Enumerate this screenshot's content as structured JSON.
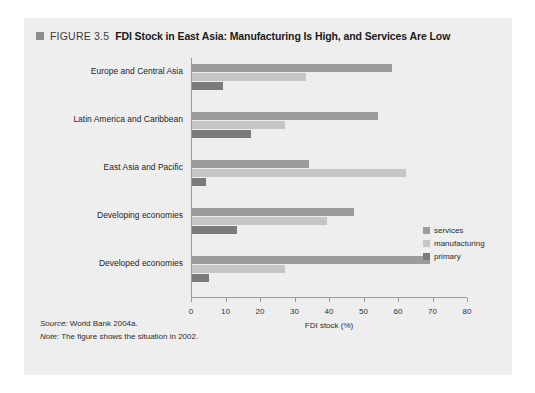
{
  "figure": {
    "marker_icon": "square-marker-icon",
    "number": "FIGURE 3.5",
    "title": "FDI Stock in East Asia: Manufacturing Is High, and Services Are Low"
  },
  "footnotes": {
    "source_key": "Source:",
    "source_text": " World Bank 2004a.",
    "note_key": "Note:",
    "note_text": " The figure shows the situation in 2002."
  },
  "colors": {
    "panel_background": "#eeeeee",
    "page_background": "#ffffff",
    "services": "#9c9c9c",
    "manufacturing": "#c6c6c6",
    "primary": "#7b7b7b",
    "axis": "#9a9a9a"
  },
  "chart_data": {
    "type": "bar",
    "orientation": "horizontal",
    "title": "FDI Stock in East Asia: Manufacturing Is High, and Services Are Low",
    "xlabel": "FDI stock (%)",
    "ylabel": "",
    "xlim": [
      0,
      80
    ],
    "xticks": [
      0,
      10,
      20,
      30,
      40,
      50,
      60,
      70,
      80
    ],
    "xticklabels": [
      "0",
      "10",
      "20",
      "30",
      "40",
      "50",
      "60",
      "70",
      "80"
    ],
    "grid": false,
    "legend_position": "right-middle",
    "categories": [
      "Europe and  Central Asia",
      "Latin America and Caribbean",
      "East Asia and Pacific",
      "Developing economies",
      "Developed economies"
    ],
    "series": [
      {
        "name": "services",
        "color": "#9c9c9c",
        "values": [
          58,
          54,
          34,
          47,
          69
        ]
      },
      {
        "name": "manufacturing",
        "color": "#c6c6c6",
        "values": [
          33,
          27,
          62,
          39,
          27
        ]
      },
      {
        "name": "primary",
        "color": "#7b7b7b",
        "values": [
          9,
          17,
          4,
          13,
          5
        ]
      }
    ]
  }
}
